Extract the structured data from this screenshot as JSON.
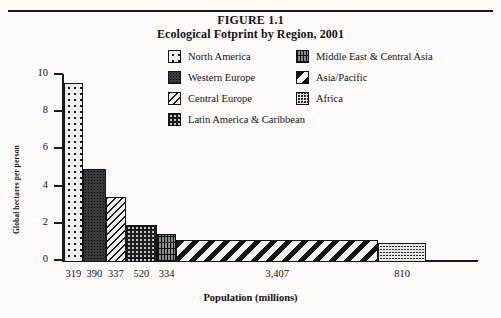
{
  "figure": {
    "number": "FIGURE 1.1",
    "title": "Ecological Fotprint by Region, 2001"
  },
  "legend": {
    "left_items": [
      {
        "label": "North America",
        "pattern": "p-dots"
      },
      {
        "label": "Western Europe",
        "pattern": "p-solid"
      },
      {
        "label": "Central Europe",
        "pattern": "p-diag"
      }
    ],
    "right_items": [
      {
        "label": "Middle East & Central Asia",
        "pattern": "p-vgrid"
      },
      {
        "label": "Asia/Pacific",
        "pattern": "p-bolddiag"
      },
      {
        "label": "Africa",
        "pattern": "p-check"
      }
    ],
    "full_item": {
      "label": "Latin America & Caribbean",
      "pattern": "p-dark-dots"
    }
  },
  "chart_data": {
    "type": "bar",
    "title": "Ecological Fotprint by Region, 2001",
    "xlabel": "Population (millions)",
    "ylabel": "Global hectares per person",
    "ylim": [
      0,
      10
    ],
    "yticks": [
      0,
      2,
      4,
      6,
      8,
      10
    ],
    "ytick_labels": [
      "0",
      "2",
      "4",
      "6",
      "8",
      "10"
    ],
    "grid": false,
    "legend_position": "top-center",
    "note": "Variable-width (Marimekko) bars: width is proportional to population, height is global hectares per person.",
    "categories": [
      "North America",
      "Western Europe",
      "Central Europe",
      "Latin America & Caribbean",
      "Middle East & Central Asia",
      "Asia/Pacific",
      "Africa"
    ],
    "values": [
      9.6,
      5.0,
      3.5,
      2.0,
      1.5,
      1.2,
      1.0
    ],
    "widths": [
      319,
      390,
      337,
      520,
      334,
      3407,
      810
    ],
    "xtick_labels": [
      "319",
      "390",
      "337",
      "520",
      "334",
      "3,407",
      "810"
    ],
    "bars": [
      {
        "name": "North America",
        "value": 9.6,
        "population": 319,
        "population_label": "319",
        "pattern": "p-dots"
      },
      {
        "name": "Western Europe",
        "value": 5.0,
        "population": 390,
        "population_label": "390",
        "pattern": "p-solid"
      },
      {
        "name": "Central Europe",
        "value": 3.5,
        "population": 337,
        "population_label": "337",
        "pattern": "p-diag"
      },
      {
        "name": "Latin America & Caribbean",
        "value": 2.0,
        "population": 520,
        "population_label": "520",
        "pattern": "p-dark-dots"
      },
      {
        "name": "Middle East & Central Asia",
        "value": 1.5,
        "population": 334,
        "population_label": "334",
        "pattern": "p-vgrid"
      },
      {
        "name": "Asia/Pacific",
        "value": 1.2,
        "population": 3407,
        "population_label": "3,407",
        "pattern": "p-bolddiag"
      },
      {
        "name": "Africa",
        "value": 1.0,
        "population": 810,
        "population_label": "810",
        "pattern": "p-check"
      }
    ]
  }
}
